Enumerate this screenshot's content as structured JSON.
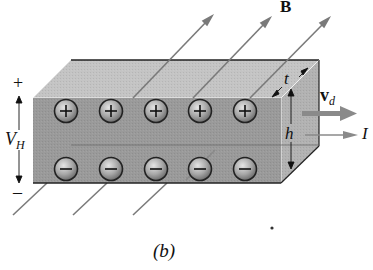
{
  "figure": {
    "caption": "(b)",
    "labels": {
      "field": "B",
      "drift_velocity_main": "v",
      "drift_velocity_sub": "d",
      "current": "I",
      "thickness": "t",
      "height": "h",
      "hall_voltage_main": "V",
      "hall_voltage_sub": "H",
      "plus_terminal": "+",
      "minus_terminal": "–"
    },
    "positive_charges": [
      "+",
      "+",
      "+",
      "+",
      "+"
    ],
    "negative_charges": [
      "–",
      "–",
      "–",
      "–",
      "–"
    ],
    "colors": {
      "slab_front": "#9a9a9a",
      "slab_top": "#c4c4c4",
      "slab_side": "#b2b2b2",
      "arrow_gray": "#8a8a8a",
      "field_line": "#7a7a7a",
      "outline": "#222222"
    }
  }
}
